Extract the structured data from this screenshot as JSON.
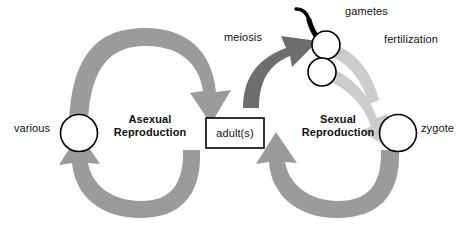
{
  "diagram": {
    "center_box": {
      "label": "adult(s)"
    },
    "cycles": [
      {
        "name": "asexual",
        "label": "Asexual\nReproduction",
        "line1": "Asexual",
        "line2": "Reproduction"
      },
      {
        "name": "sexual",
        "label": "Sexual\nReproduction",
        "line1": "Sexual",
        "line2": "Reproduction"
      }
    ],
    "nodes": [
      {
        "id": "various",
        "label": "various",
        "shape": "circle"
      },
      {
        "id": "gametes",
        "label": "gametes",
        "shape": "two-circles-sperm-egg"
      },
      {
        "id": "zygote",
        "label": "zygote",
        "shape": "circle"
      }
    ],
    "processes": [
      {
        "id": "meiosis",
        "label": "meiosis"
      },
      {
        "id": "fertilization",
        "label": "fertilization"
      }
    ],
    "arrows": [
      {
        "id": "asexual-top",
        "from": "various",
        "to": "adults",
        "tone": "medium"
      },
      {
        "id": "asexual-bottom",
        "from": "adults",
        "to": "various",
        "tone": "medium"
      },
      {
        "id": "meiosis-arrow",
        "from": "adults",
        "to": "gametes",
        "tone": "dark"
      },
      {
        "id": "fertilization-arrow",
        "from": "gametes",
        "to": "zygote",
        "tone": "light"
      },
      {
        "id": "sexual-bottom",
        "from": "zygote",
        "to": "adults",
        "tone": "medium"
      }
    ],
    "colors": {
      "arrow_medium": "#9b9b9b",
      "arrow_dark": "#6e6e6e",
      "arrow_light": "#cccccc",
      "outline": "#000000",
      "text": "#111111",
      "background": "#ffffff"
    }
  }
}
